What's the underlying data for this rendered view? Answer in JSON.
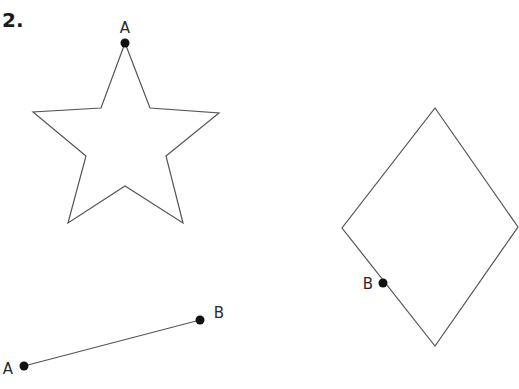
{
  "problem": {
    "number_label": "2."
  },
  "figures": {
    "star": {
      "points": "125,43 150,108 219,113 166,156 183,223 125,186 68,223 86,156 33,112 101,108",
      "marked_point": {
        "label": "A",
        "x": 125,
        "y": 43,
        "label_x": 125,
        "label_y": 33
      }
    },
    "rhombus": {
      "points": "435,108 518,227 435,346 342,228",
      "marked_point": {
        "label": "B",
        "x": 383,
        "y": 283,
        "label_x": 368,
        "label_y": 289
      }
    },
    "segment": {
      "start": {
        "label": "A",
        "x": 24,
        "y": 366,
        "label_x": 8,
        "label_y": 374
      },
      "end": {
        "label": "B",
        "x": 200,
        "y": 320,
        "label_x": 219,
        "label_y": 318
      }
    }
  },
  "colors": {
    "stroke": "#555555",
    "point": "#111111"
  }
}
